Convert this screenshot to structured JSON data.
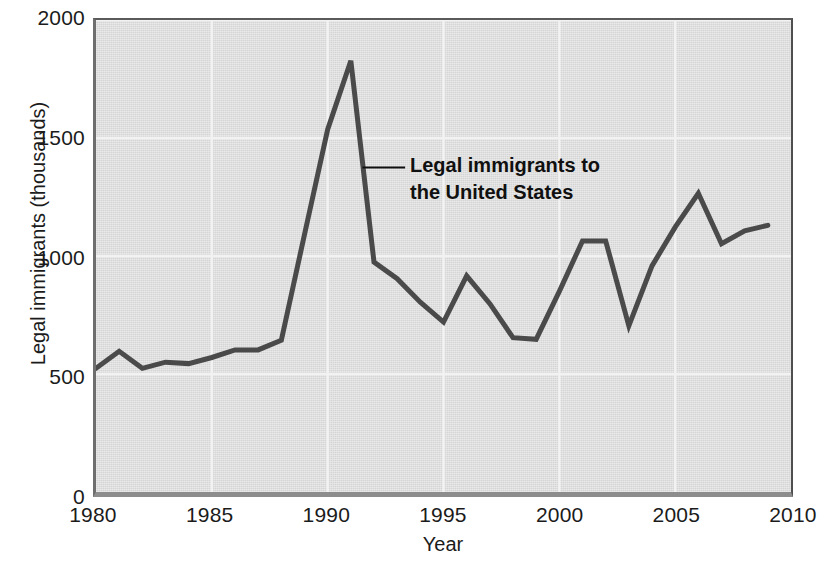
{
  "chart_data": {
    "type": "line",
    "title": "",
    "xlabel": "Year",
    "ylabel": "Legal immigrants (thousands)",
    "xlim": [
      1980,
      2010
    ],
    "ylim": [
      0,
      2000
    ],
    "xticks": [
      "1980",
      "1985",
      "1990",
      "1995",
      "2000",
      "2005",
      "2010"
    ],
    "xtick_values": [
      1980,
      1985,
      1990,
      1995,
      2000,
      2005,
      2010
    ],
    "yticks": [
      "0",
      "500",
      "1000",
      "1500",
      "2000"
    ],
    "ytick_values": [
      0,
      500,
      1000,
      1500,
      2000
    ],
    "grid": true,
    "grid_color": "#f2f2f2",
    "plot_background": "#d5d5d5",
    "line_color": "#4a4a4a",
    "line_width": 5,
    "legend": "none",
    "series": [
      {
        "name": "Legal immigrants to the United States",
        "x": [
          1980,
          1981,
          1982,
          1983,
          1984,
          1985,
          1986,
          1987,
          1988,
          1989,
          1990,
          1991,
          1992,
          1993,
          1994,
          1995,
          1996,
          1997,
          1998,
          1999,
          2000,
          2001,
          2002,
          2003,
          2004,
          2005,
          2006,
          2007,
          2008,
          2009
        ],
        "values": [
          524,
          596,
          524,
          550,
          544,
          570,
          602,
          602,
          643,
          1091,
          1536,
          1827,
          974,
          904,
          804,
          720,
          916,
          798,
          654,
          647,
          850,
          1064,
          1064,
          704,
          958,
          1122,
          1266,
          1052,
          1107,
          1130
        ]
      }
    ],
    "annotations": [
      {
        "text": "Legal immigrants to\nthe United States",
        "bold": true,
        "anchor_x": 1991.5,
        "anchor_y": 1375,
        "leader": true
      }
    ]
  }
}
